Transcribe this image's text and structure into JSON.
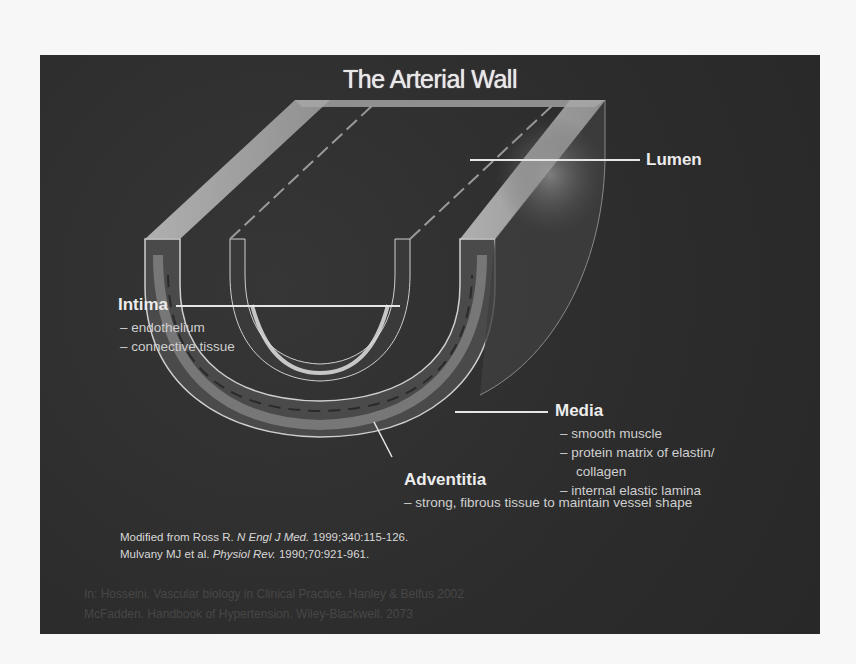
{
  "slide": {
    "title": "The Arterial Wall",
    "colors": {
      "background": "#2f2f2f",
      "page": "#f7f7f7",
      "text": "#ececec",
      "subtext": "#cfcfcf"
    },
    "labels": {
      "lumen": {
        "title": "Lumen",
        "items": []
      },
      "intima": {
        "title": "Intima",
        "items": [
          "– endothelium",
          "– connective tissue"
        ]
      },
      "media": {
        "title": "Media",
        "items": [
          "– smooth muscle",
          "– protein matrix of elastin/",
          "collagen",
          "– internal elastic lamina"
        ]
      },
      "adventitia": {
        "title": "Adventitia",
        "items": [
          "– strong, fibrous tissue to maintain vessel shape"
        ]
      }
    },
    "references": {
      "line1": {
        "authors": "Modified from Ross R.",
        "journal": "N Engl J Med.",
        "details": "1999;340:115-126."
      },
      "line2": {
        "authors": "Mulvany MJ et al.",
        "journal": "Physiol Rev.",
        "details": "1990;70:921-961."
      }
    },
    "footer_faint": [
      "In: Hosseini. Vascular biology in Clinical Practice. Hanley & Belfus 2002",
      "McFadden. Handbook of Hypertension. Wiley-Blackwell. 2073"
    ]
  }
}
